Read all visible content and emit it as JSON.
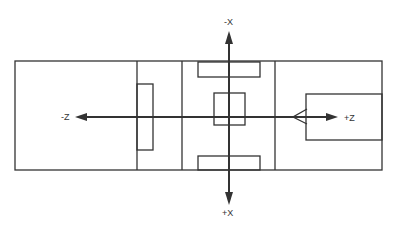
{
  "diagram": {
    "type": "coordinate-axes-layout",
    "axes": {
      "x_negative": "-X",
      "x_positive": "+X",
      "z_negative": "-Z",
      "z_positive": "+Z"
    },
    "colors": {
      "line": "#333333",
      "background": "#ffffff"
    }
  }
}
